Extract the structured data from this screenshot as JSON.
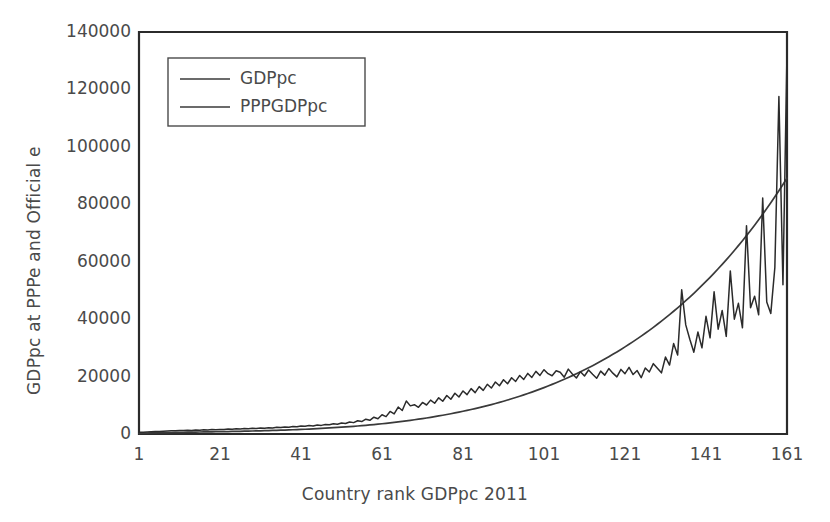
{
  "chart_data": {
    "type": "line",
    "title": "",
    "xlabel": "Country rank GDPpc 2011",
    "ylabel": "GDPpc at PPPe and Official e",
    "xlim": [
      1,
      161
    ],
    "ylim": [
      0,
      140000
    ],
    "xticks": [
      1,
      21,
      41,
      61,
      81,
      101,
      121,
      141,
      161
    ],
    "xtick_labels": [
      "1",
      "21",
      "41",
      "61",
      "81",
      "101",
      "121",
      "141",
      "161"
    ],
    "yticks": [
      0,
      20000,
      40000,
      60000,
      80000,
      100000,
      120000,
      140000
    ],
    "ytick_labels": [
      "0",
      "20000",
      "40000",
      "60000",
      "80000",
      "100000",
      "120000",
      "140000"
    ],
    "grid": false,
    "legend_position": "upper left",
    "line_color": "#3a3a3a",
    "frame_color": "#2b2b2b",
    "background": "#ffffff",
    "series": [
      {
        "name": "GDPpc",
        "color": "#3a3a3a",
        "values": [
          231,
          271,
          330,
          371,
          398,
          432,
          460,
          491,
          520,
          549,
          575,
          600,
          622,
          645,
          668,
          690,
          712,
          735,
          760,
          782,
          805,
          830,
          858,
          885,
          912,
          940,
          972,
          1005,
          1040,
          1075,
          1112,
          1150,
          1190,
          1232,
          1278,
          1325,
          1375,
          1428,
          1482,
          1540,
          1600,
          1662,
          1728,
          1796,
          1868,
          1942,
          2020,
          2102,
          2188,
          2278,
          2372,
          2470,
          2572,
          2680,
          2792,
          2910,
          3032,
          3160,
          3292,
          3430,
          3575,
          3725,
          3880,
          4042,
          4210,
          4385,
          4568,
          4756,
          4952,
          5155,
          5365,
          5582,
          5808,
          6040,
          6282,
          6530,
          6788,
          7055,
          7330,
          7615,
          7908,
          8212,
          8525,
          8848,
          9182,
          9528,
          9882,
          10250,
          10628,
          11018,
          11420,
          11835,
          12262,
          12702,
          13155,
          13620,
          14100,
          14595,
          15100,
          15620,
          16155,
          16705,
          17270,
          17850,
          18445,
          19058,
          19685,
          20330,
          20990,
          21670,
          22365,
          23078,
          23808,
          24558,
          25325,
          26112,
          26918,
          27742,
          28588,
          29452,
          30338,
          31245,
          32172,
          33122,
          34095,
          35090,
          36108,
          37150,
          38218,
          39310,
          40428,
          41572,
          42742,
          43940,
          45165,
          46420,
          47702,
          49015,
          50358,
          51732,
          53138,
          54575,
          56045,
          57550,
          59088,
          60662,
          62272,
          63918,
          65602,
          67325,
          69088,
          70890,
          72735,
          74620,
          76550,
          78525,
          80545,
          82612,
          84728,
          86892,
          89108
        ]
      },
      {
        "name": "PPPGDPpc",
        "color": "#2b2b2b",
        "values": [
          580,
          640,
          705,
          760,
          830,
          890,
          950,
          1020,
          1090,
          1160,
          1230,
          1190,
          1300,
          1250,
          1380,
          1330,
          1450,
          1400,
          1530,
          1470,
          1610,
          1560,
          1700,
          1640,
          1790,
          1730,
          1880,
          1820,
          1980,
          1910,
          2090,
          2010,
          2200,
          2120,
          2320,
          2240,
          2450,
          2360,
          2600,
          2500,
          2760,
          2660,
          2930,
          2820,
          3120,
          3000,
          3340,
          3200,
          3580,
          3420,
          3860,
          3660,
          4200,
          3960,
          4620,
          4320,
          5150,
          4760,
          5850,
          5320,
          6700,
          6050,
          7850,
          7000,
          9400,
          8200,
          11500,
          9800,
          10200,
          9300,
          11000,
          10100,
          11800,
          10700,
          12600,
          11400,
          13400,
          12100,
          14200,
          12900,
          15000,
          13700,
          15800,
          14400,
          16500,
          15200,
          17300,
          16000,
          18100,
          16800,
          18900,
          17500,
          19600,
          18300,
          20400,
          19000,
          21100,
          19700,
          21800,
          20400,
          22400,
          21000,
          20300,
          22000,
          21500,
          19800,
          22600,
          20900,
          19500,
          21700,
          20200,
          22300,
          20800,
          19400,
          21900,
          20500,
          22800,
          21200,
          19900,
          22500,
          21000,
          23200,
          20700,
          22100,
          19600,
          23000,
          21600,
          24500,
          22900,
          21300,
          26800,
          24000,
          31500,
          27500,
          50200,
          38000,
          33000,
          28500,
          35500,
          30000,
          41000,
          33500,
          49500,
          36500,
          43000,
          34000,
          56800,
          40000,
          45500,
          37000,
          72500,
          44000,
          48000,
          41500,
          82200,
          46000,
          42000,
          58000,
          117500,
          52000,
          133300
        ]
      }
    ]
  },
  "legend": {
    "items": [
      {
        "label": "GDPpc"
      },
      {
        "label": "PPPGDPpc"
      }
    ]
  },
  "axes": {
    "y_title": "GDPpc at PPPe and Official e",
    "x_title": "Country rank GDPpc 2011"
  }
}
